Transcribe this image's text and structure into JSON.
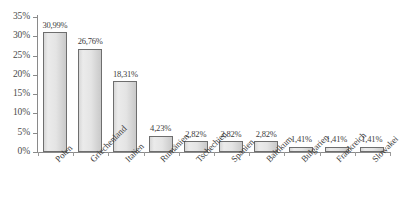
{
  "chart_data": {
    "type": "bar",
    "title": "",
    "subtitle": "",
    "xlabel": "",
    "ylabel": "",
    "categories": [
      "Polen",
      "Griechenland",
      "Italien",
      "Rumänien",
      "Tschechien",
      "Spanien",
      "Baltikum",
      "Bulgarien",
      "Frankreich",
      "Slowakei"
    ],
    "values": [
      30.99,
      26.76,
      18.31,
      4.23,
      2.82,
      2.82,
      2.82,
      1.41,
      1.41,
      1.41
    ],
    "data_labels": [
      "30,99%",
      "26,76%",
      "18,31%",
      "4,23%",
      "2,82%",
      "2,82%",
      "2,82%",
      "1,41%",
      "1,41%",
      "1,41%"
    ],
    "ylim": [
      0,
      35
    ],
    "ytick_values": [
      0,
      5,
      10,
      15,
      20,
      25,
      30,
      35
    ],
    "ytick_labels": [
      "0%",
      "5%",
      "10%",
      "15%",
      "20%",
      "25%",
      "30%",
      "35%"
    ],
    "grid": false,
    "legend": false,
    "legend_position": "none",
    "series": [
      {
        "name": "",
        "values": [
          30.99,
          26.76,
          18.31,
          4.23,
          2.82,
          2.82,
          2.82,
          1.41,
          1.41,
          1.41
        ]
      }
    ],
    "colors": {
      "bar_fill_light": "#ebebeb",
      "bar_fill_dark": "#c9c9c9",
      "bar_border": "#6e6e6e",
      "axis": "#8a8a8a",
      "text": "#3a3a3a",
      "background": "#ffffff"
    }
  }
}
